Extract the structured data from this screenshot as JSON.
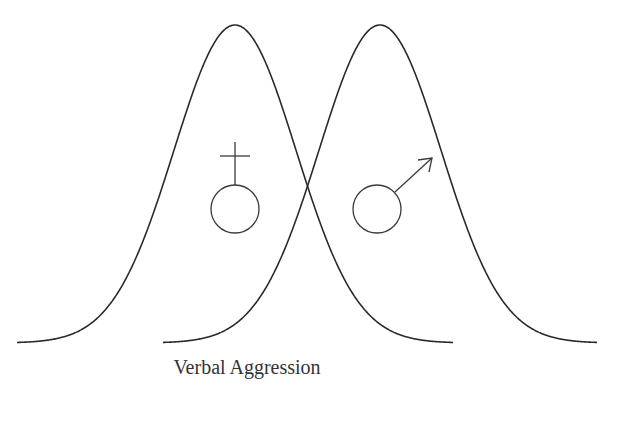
{
  "chart_data": {
    "type": "line",
    "title": "",
    "xlabel": "Verbal Aggression",
    "ylabel": "",
    "grid": false,
    "legend": "none",
    "series": [
      {
        "name": "Female",
        "symbol": "♀",
        "distribution": "normal",
        "mean_px": 235,
        "sigma_px": 61,
        "x_range_px": [
          17,
          453
        ]
      },
      {
        "name": "Male",
        "symbol": "♂",
        "distribution": "normal",
        "mean_px": 380,
        "sigma_px": 61,
        "x_range_px": [
          163,
          597
        ]
      }
    ],
    "baseline_px": 343,
    "peak_px": 25,
    "annotations": [
      {
        "text": "♀",
        "meaning": "female symbol",
        "position": "left curve"
      },
      {
        "text": "♂",
        "meaning": "male symbol",
        "position": "right curve"
      }
    ]
  },
  "figure": {
    "xlabel": "Verbal Aggression",
    "colors": {
      "stroke": "#2a2a2a",
      "background": "#ffffff"
    }
  }
}
